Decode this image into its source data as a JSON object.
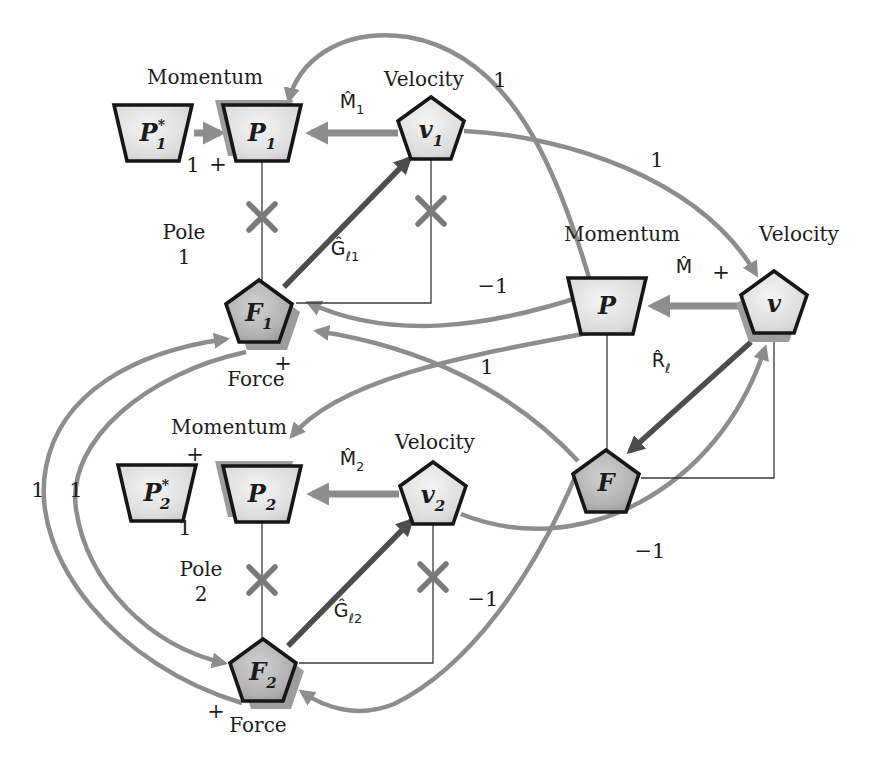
{
  "figure": {
    "kind": "signal-flow-diagram",
    "background": "#ffffff",
    "colors": {
      "node_border": "#161616",
      "node_light_center": "#f2f2f2",
      "node_light_edge": "#c2c2c2",
      "node_dark_center": "#cccccc",
      "node_dark_edge": "#8f8f8f",
      "shadow": "#9d9d9d",
      "gray_arrow": "#8d8d8d",
      "dark_arrow": "#4d4d4d",
      "thin_line": "#3a3a3a",
      "x_mark": "#7a7a7a",
      "text": "#1c1c1c"
    },
    "nodes": [
      {
        "id": "P1-star",
        "name": "node-p1-star",
        "shape": "trapezoid",
        "x": 153,
        "y": 133,
        "label": {
          "main": "P",
          "sup": "*",
          "sub": "1"
        },
        "dark": false,
        "shadow": null
      },
      {
        "id": "P1",
        "name": "node-p1",
        "shape": "trapezoid",
        "x": 262,
        "y": 133,
        "label": {
          "main": "P",
          "sub": "1"
        },
        "dark": false,
        "shadow": {
          "dx": -8,
          "dy": -5
        }
      },
      {
        "id": "v1",
        "name": "node-v1",
        "shape": "pentagon",
        "x": 431,
        "y": 130,
        "label": {
          "main": "v",
          "sub": "1"
        },
        "dark": false,
        "shadow": null
      },
      {
        "id": "F1",
        "name": "node-f1",
        "shape": "pentagon",
        "x": 259,
        "y": 313,
        "label": {
          "main": "F",
          "sub": "1"
        },
        "dark": true,
        "shadow": {
          "dx": 8,
          "dy": 8
        }
      },
      {
        "id": "P",
        "name": "node-p",
        "shape": "trapezoid",
        "x": 607,
        "y": 306,
        "label": {
          "main": "P"
        },
        "dark": false,
        "shadow": null
      },
      {
        "id": "v",
        "name": "node-v",
        "shape": "pentagon",
        "x": 774,
        "y": 304,
        "label": {
          "main": "v"
        },
        "dark": false,
        "shadow": {
          "dx": -5,
          "dy": 9
        }
      },
      {
        "id": "F",
        "name": "node-f",
        "shape": "pentagon",
        "x": 606,
        "y": 483,
        "label": {
          "main": "F"
        },
        "dark": true,
        "shadow": null
      },
      {
        "id": "P2-star",
        "name": "node-p2-star",
        "shape": "trapezoid",
        "x": 157,
        "y": 493,
        "label": {
          "main": "P",
          "sup": "*",
          "sub": "2"
        },
        "dark": false,
        "shadow": null
      },
      {
        "id": "P2",
        "name": "node-p2",
        "shape": "trapezoid",
        "x": 262,
        "y": 494,
        "label": {
          "main": "P",
          "sub": "2"
        },
        "dark": false,
        "shadow": {
          "dx": -8,
          "dy": -5
        }
      },
      {
        "id": "v2",
        "name": "node-v2",
        "shape": "pentagon",
        "x": 433,
        "y": 495,
        "label": {
          "main": "v",
          "sub": "2"
        },
        "dark": false,
        "shadow": null
      },
      {
        "id": "F2",
        "name": "node-f2",
        "shape": "pentagon",
        "x": 263,
        "y": 672,
        "label": {
          "main": "F",
          "sub": "2"
        },
        "dark": true,
        "shadow": {
          "dx": 8,
          "dy": 8
        }
      }
    ],
    "straight_arrows": [
      {
        "name": "arrow-p1star-to-p1",
        "from": "P1-star",
        "to": "P1",
        "tone": "gray",
        "x1": 194,
        "y1": 133,
        "x2": 220,
        "y2": 133
      },
      {
        "name": "arrow-v1-to-p1",
        "from": "v1",
        "to": "P1",
        "tone": "gray",
        "x1": 398,
        "y1": 133,
        "x2": 311,
        "y2": 133
      },
      {
        "name": "arrow-v-to-p",
        "from": "v",
        "to": "P",
        "tone": "gray",
        "x1": 740,
        "y1": 306,
        "x2": 653,
        "y2": 306
      },
      {
        "name": "arrow-v2-to-p2",
        "from": "v2",
        "to": "P2",
        "tone": "gray",
        "x1": 399,
        "y1": 494,
        "x2": 312,
        "y2": 494
      },
      {
        "name": "arrow-f1-to-v1",
        "from": "F1",
        "to": "v1",
        "tone": "dark",
        "x1": 284,
        "y1": 287,
        "x2": 409,
        "y2": 159
      },
      {
        "name": "arrow-f2-to-v2",
        "from": "F2",
        "to": "v2",
        "tone": "dark",
        "x1": 288,
        "y1": 646,
        "x2": 411,
        "y2": 521
      },
      {
        "name": "arrow-v-to-f",
        "from": "v",
        "to": "F",
        "tone": "dark",
        "x1": 751,
        "y1": 342,
        "x2": 630,
        "y2": 451
      }
    ],
    "curves": [
      {
        "name": "curve-p-to-p1",
        "from": "P",
        "to": "P1",
        "gain": "1",
        "path": "M 590,281 C 556,165 510,55 408,37 C 338,27 297,64 289,100"
      },
      {
        "name": "curve-v1-to-v",
        "from": "v1",
        "to": "v",
        "gain": "1 +",
        "path": "M 464,131 C 565,136 700,178 756,274"
      },
      {
        "name": "curve-p-to-f1",
        "from": "P",
        "to": "F1",
        "gain": "-1",
        "path": "M 583,296 C 488,327 392,341 309,303"
      },
      {
        "name": "curve-f-to-f1",
        "from": "F",
        "to": "F1",
        "gain": "1",
        "path": "M 578,461 C 512,390 422,347 317,331"
      },
      {
        "name": "curve-p-to-p2",
        "from": "P",
        "to": "P2",
        "gain": "1",
        "path": "M 588,333 C 478,354 342,376 292,436"
      },
      {
        "name": "curve-v2-to-v",
        "from": "v2",
        "to": "v",
        "gain": "-1",
        "path": "M 461,514 C 578,561 718,492 765,348"
      },
      {
        "name": "curve-f-to-f2",
        "from": "F",
        "to": "F2",
        "gain": "-1",
        "path": "M 578,470 C 534,577 468,668 394,704 C 357,719 324,707 302,692"
      },
      {
        "name": "curve-f2-to-f1",
        "from": "F2",
        "to": "F1",
        "gain": "1",
        "path": "M 242,703 C 118,667 28,558 46,467 C 60,394 132,352 226,339"
      },
      {
        "name": "curve-f1-to-f2",
        "from": "F1",
        "to": "F2",
        "gain": "1",
        "path": "M 246,352 C 148,373 66,440 76,509 C 87,584 150,646 224,663"
      }
    ],
    "thin_lines": [
      {
        "name": "line-p1-to-f1",
        "path": "M 262,161 L 262,285"
      },
      {
        "name": "line-v1-to-f1",
        "path": "M 431,159 L 431,303 L 296,303"
      },
      {
        "name": "line-p-to-f",
        "path": "M 607,334 L 607,452"
      },
      {
        "name": "line-v-to-f",
        "path": "M 774,333 L 774,478 L 641,478"
      },
      {
        "name": "line-p2-to-f2",
        "path": "M 262,522 L 262,643"
      },
      {
        "name": "line-v2-to-f2",
        "path": "M 433,524 L 433,663 L 299,663"
      }
    ],
    "x_marks": [
      {
        "name": "x-mark-p1",
        "x": 262,
        "y": 217
      },
      {
        "name": "x-mark-v1",
        "x": 431,
        "y": 211
      },
      {
        "name": "x-mark-p2",
        "x": 262,
        "y": 580
      },
      {
        "name": "x-mark-v2",
        "x": 433,
        "y": 577
      }
    ],
    "word_labels": [
      {
        "text": "Momentum",
        "x": 205,
        "y": 84
      },
      {
        "text": "Velocity",
        "x": 424,
        "y": 86
      },
      {
        "text": "Momentum",
        "x": 622,
        "y": 241
      },
      {
        "text": "Velocity",
        "x": 799,
        "y": 241
      },
      {
        "text": "Momentum",
        "x": 229,
        "y": 434
      },
      {
        "text": "Velocity",
        "x": 435,
        "y": 449
      },
      {
        "text": "Pole",
        "x": 184,
        "y": 239
      },
      {
        "text": "1",
        "x": 184,
        "y": 264
      },
      {
        "text": "Pole",
        "x": 201,
        "y": 576
      },
      {
        "text": "2",
        "x": 201,
        "y": 601
      },
      {
        "text": "Force",
        "x": 256,
        "y": 386
      },
      {
        "text": "Force",
        "x": 258,
        "y": 732
      }
    ],
    "gain_labels": [
      {
        "text": "1",
        "x": 193,
        "y": 172
      },
      {
        "text": "+",
        "x": 218,
        "y": 171
      },
      {
        "text": "1",
        "x": 500,
        "y": 87
      },
      {
        "text": "1",
        "x": 657,
        "y": 167
      },
      {
        "text": "+",
        "x": 721,
        "y": 279
      },
      {
        "text": "−1",
        "x": 493,
        "y": 293
      },
      {
        "text": "1",
        "x": 487,
        "y": 374
      },
      {
        "text": "1",
        "x": 38,
        "y": 497
      },
      {
        "text": "1",
        "x": 76,
        "y": 497
      },
      {
        "text": "+",
        "x": 195,
        "y": 461
      },
      {
        "text": "1",
        "x": 185,
        "y": 535
      },
      {
        "text": "−1",
        "x": 650,
        "y": 558
      },
      {
        "text": "−1",
        "x": 483,
        "y": 606
      },
      {
        "text": "+",
        "x": 283,
        "y": 370
      },
      {
        "text": "+",
        "x": 216,
        "y": 718
      }
    ],
    "operator_labels": [
      {
        "main": "M̂",
        "sub": "1",
        "x": 352,
        "y": 108
      },
      {
        "main": "M̂",
        "sub": "",
        "x": 684,
        "y": 273
      },
      {
        "main": "M̂",
        "sub": "2",
        "x": 352,
        "y": 465
      },
      {
        "main": "Ĝ",
        "sub": "ℓ1",
        "x": 345,
        "y": 255
      },
      {
        "main": "Ĝ",
        "sub": "ℓ2",
        "x": 348,
        "y": 617
      },
      {
        "main": "R̂",
        "sub": "ℓ",
        "x": 661,
        "y": 367
      }
    ]
  }
}
